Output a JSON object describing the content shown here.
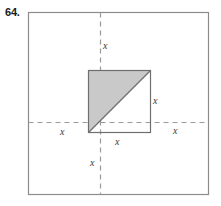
{
  "problem": {
    "number": "64."
  },
  "figure": {
    "outer_square": {
      "name": "outer-square",
      "x": 28,
      "y": 12,
      "size": 180,
      "stroke": "#8c8c8c",
      "fill": "#ffffff"
    },
    "inner_square": {
      "name": "inner-square",
      "x": 88,
      "y": 70,
      "size": 62,
      "stroke": "#6e6e6e",
      "fill": "#ffffff"
    },
    "shaded_triangle": {
      "name": "shaded-triangle",
      "description": "upper-left half of inner square",
      "points": "88,70 150,70 88,132",
      "fill": "#c9c9c9",
      "stroke": "#6e6e6e"
    },
    "diagonal": {
      "name": "diagonal-line",
      "x1": 88,
      "y1": 132,
      "x2": 150,
      "y2": 70,
      "stroke": "#6e6e6e"
    },
    "vertical_dashed_line": {
      "name": "vertical-dashed-axis",
      "x": 100,
      "y1": 12,
      "y2": 194,
      "stroke": "#9a9a9a",
      "dash": "5 4"
    },
    "horizontal_dashed_line": {
      "name": "horizontal-dashed-axis",
      "y": 122,
      "x1": 28,
      "x2": 208,
      "stroke": "#9a9a9a",
      "dash": "5 4"
    },
    "labels": [
      {
        "name": "label-x-top",
        "text": "x",
        "left": 103,
        "top": 41
      },
      {
        "name": "label-x-right",
        "text": "x",
        "left": 153,
        "top": 96
      },
      {
        "name": "label-x-bottom-inner",
        "text": "x",
        "left": 115,
        "top": 137
      },
      {
        "name": "label-x-left",
        "text": "x",
        "left": 60,
        "top": 127
      },
      {
        "name": "label-x-far-right",
        "text": "x",
        "left": 173,
        "top": 126
      },
      {
        "name": "label-x-below",
        "text": "x",
        "left": 90,
        "top": 158
      }
    ]
  }
}
